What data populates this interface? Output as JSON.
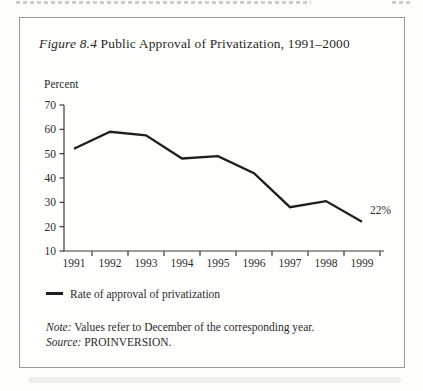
{
  "figure": {
    "label": "Figure 8.4",
    "title": " Public Approval of Privatization, 1991–2000"
  },
  "chart_data": {
    "type": "line",
    "title": "Figure 8.4 Public Approval of Privatization, 1991–2000",
    "xlabel": "",
    "ylabel": "Percent",
    "categories": [
      "1991",
      "1992",
      "1993",
      "1994",
      "1995",
      "1996",
      "1997",
      "1998",
      "1999"
    ],
    "series": [
      {
        "name": "Rate of approval of privatization",
        "values": [
          52,
          59,
          57.5,
          48,
          49,
          42,
          28,
          30.5,
          22
        ]
      }
    ],
    "ylim": [
      10,
      70
    ],
    "yticks": [
      70,
      60,
      50,
      40,
      30,
      20,
      10
    ],
    "grid": false,
    "legend_position": "bottom-left",
    "line_color": "#1e1e1e",
    "annotation": {
      "text": "22%",
      "category": "1999",
      "value": 22
    }
  },
  "notes": {
    "note_label": "Note:",
    "note_text": " Values refer to December of the corresponding year.",
    "source_label": "Source:",
    "source_text": " PROINVERSION."
  }
}
